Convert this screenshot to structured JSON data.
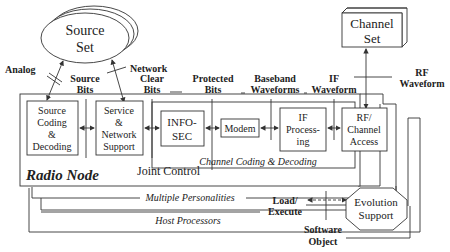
{
  "diagram": {
    "title": "Radio Node",
    "nodes": {
      "source_set": {
        "line1": "Source",
        "line2": "Set"
      },
      "channel_set": {
        "line1": "Channel",
        "line2": "Set"
      },
      "source_coding": {
        "line1": "Source",
        "line2": "Coding",
        "line3": "&",
        "line4": "Decoding"
      },
      "service_network": {
        "line1": "Service",
        "line2": "&",
        "line3": "Network",
        "line4": "Support"
      },
      "infosec": {
        "line1": "INFO-",
        "line2": "SEC"
      },
      "modem": {
        "label": "Modem"
      },
      "if_processing": {
        "line1": "IF",
        "line2": "Process-",
        "line3": "ing"
      },
      "rf_channel": {
        "line1": "RF/",
        "line2": "Channel",
        "line3": "Access"
      },
      "evolution_support": {
        "line1": "Evolution",
        "line2": "Support"
      }
    },
    "labels": {
      "analog": "Analog",
      "network": "Network",
      "source_bits": {
        "line1": "Source",
        "line2": "Bits"
      },
      "clear_bits": {
        "line1": "Clear",
        "line2": "Bits"
      },
      "protected_bits": {
        "line1": "Protected",
        "line2": "Bits"
      },
      "baseband": {
        "line1": "Baseband",
        "line2": "Waveforms"
      },
      "if_waveform": {
        "line1": "IF",
        "line2": "Waveform"
      },
      "rf_waveform": {
        "line1": "RF",
        "line2": "Waveform"
      },
      "joint_control": "Joint Control",
      "channel_coding": "Channel Coding & Decoding",
      "multiple_personalities": "Multiple Personalities",
      "host_processors": "Host Processors",
      "load_execute": {
        "line1": "Load/",
        "line2": "Execute"
      },
      "software_object": {
        "line1": "Software",
        "line2": "Object"
      }
    },
    "colors": {
      "line": "#333333",
      "text": "#222222",
      "background": "#ffffff"
    }
  }
}
